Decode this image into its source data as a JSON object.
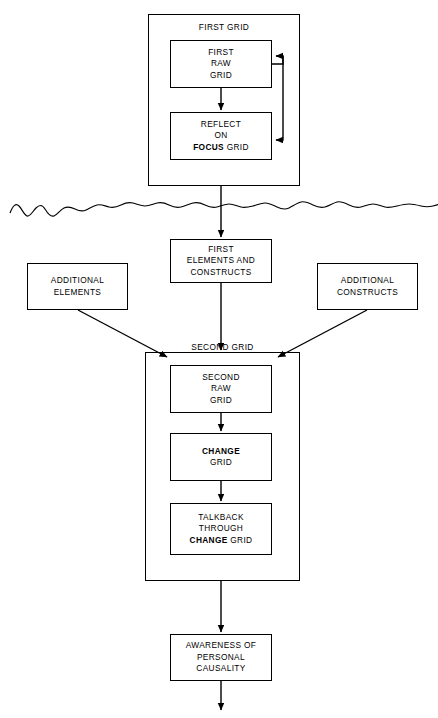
{
  "diagram": {
    "type": "flowchart",
    "background_color": "#ffffff",
    "line_color": "#000000",
    "containers": [
      {
        "id": "first-grid",
        "label": "FIRST GRID",
        "x": 148,
        "y": 14,
        "w": 152,
        "h": 172
      },
      {
        "id": "second-grid",
        "label": "SECOND GRID",
        "x": 145,
        "y": 352,
        "w": 155,
        "h": 229
      }
    ],
    "nodes": [
      {
        "id": "first-raw-grid",
        "lines": [
          "FIRST",
          "RAW",
          "GRID"
        ],
        "bold_words": [],
        "x": 170,
        "y": 40,
        "w": 102,
        "h": 48
      },
      {
        "id": "reflect-on-focus-grid",
        "lines": [
          "REFLECT",
          "ON",
          "FOCUS GRID"
        ],
        "bold_words": [
          "FOCUS"
        ],
        "x": 170,
        "y": 112,
        "w": 102,
        "h": 48
      },
      {
        "id": "first-elements-and-constructs",
        "lines": [
          "FIRST",
          "ELEMENTS AND",
          "CONSTRUCTS"
        ],
        "bold_words": [],
        "x": 170,
        "y": 239,
        "w": 102,
        "h": 44
      },
      {
        "id": "additional-elements",
        "lines": [
          "ADDITIONAL",
          "ELEMENTS"
        ],
        "bold_words": [],
        "x": 27,
        "y": 263,
        "w": 101,
        "h": 47
      },
      {
        "id": "additional-constructs",
        "lines": [
          "ADDITIONAL",
          "CONSTRUCTS"
        ],
        "bold_words": [],
        "x": 317,
        "y": 263,
        "w": 101,
        "h": 47
      },
      {
        "id": "second-raw-grid",
        "lines": [
          "SECOND",
          "RAW",
          "GRID"
        ],
        "bold_words": [],
        "x": 170,
        "y": 365,
        "w": 102,
        "h": 48
      },
      {
        "id": "change-grid",
        "lines": [
          "CHANGE",
          "GRID"
        ],
        "bold_words": [
          "CHANGE"
        ],
        "x": 170,
        "y": 433,
        "w": 102,
        "h": 48
      },
      {
        "id": "talkback-through-change-grid",
        "lines": [
          "TALKBACK",
          "THROUGH",
          "CHANGE GRID"
        ],
        "bold_words": [
          "CHANGE"
        ],
        "x": 170,
        "y": 503,
        "w": 102,
        "h": 52
      },
      {
        "id": "awareness-of-personal-causality",
        "lines": [
          "AWARENESS OF",
          "PERSONAL",
          "CAUSALITY"
        ],
        "bold_words": [],
        "x": 170,
        "y": 634,
        "w": 102,
        "h": 47
      }
    ],
    "connectors": [
      {
        "id": "raw-to-reflect",
        "from": "first-raw-grid",
        "to": "reflect-on-focus-grid",
        "style": "arrow-down"
      },
      {
        "id": "feedback-loop-first-grid",
        "from": "reflect-on-focus-grid",
        "to": "first-raw-grid",
        "style": "bidirectional-side-loop"
      },
      {
        "id": "first-grid-to-elements",
        "from": "first-grid",
        "to": "first-elements-and-constructs",
        "style": "arrow-down-through-break"
      },
      {
        "id": "elements-to-second-grid",
        "from": "first-elements-and-constructs",
        "to": "second-grid",
        "style": "arrow-down"
      },
      {
        "id": "additional-elements-to-second-grid",
        "from": "additional-elements",
        "to": "second-grid",
        "style": "arrow-diagonal"
      },
      {
        "id": "additional-constructs-to-second-grid",
        "from": "additional-constructs",
        "to": "second-grid",
        "style": "arrow-diagonal"
      },
      {
        "id": "second-raw-to-change",
        "from": "second-raw-grid",
        "to": "change-grid",
        "style": "arrow-down"
      },
      {
        "id": "change-to-talkback",
        "from": "change-grid",
        "to": "talkback-through-change-grid",
        "style": "arrow-down"
      },
      {
        "id": "second-grid-to-awareness",
        "from": "second-grid",
        "to": "awareness-of-personal-causality",
        "style": "arrow-down"
      },
      {
        "id": "awareness-outflow",
        "from": "awareness-of-personal-causality",
        "to": null,
        "style": "arrow-down-open"
      }
    ],
    "break_line": {
      "id": "wavy-break-line",
      "label": "",
      "y": 208,
      "x_start": 10,
      "x_end": 438
    }
  }
}
